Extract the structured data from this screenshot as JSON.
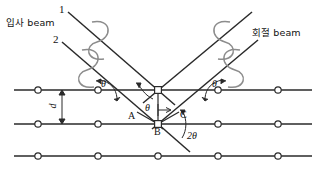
{
  "figure": {
    "colors": {
      "line": "#2a2a2a",
      "wave": "#8c8c8c",
      "text": "#111111",
      "background": "#ffffff",
      "atom_fill": "#ffffff"
    }
  },
  "labels": {
    "incident_beam": "입사 beam",
    "diffracted_beam": "회절 beam",
    "ray_1": "1",
    "ray_2": "2",
    "point_a": "A",
    "point_b": "B",
    "point_c": "C",
    "spacing": "d",
    "theta_left_surface": "θ",
    "theta_right_surface": "θ",
    "theta_interior": "θ",
    "two_theta": "2θ"
  },
  "geometry": {
    "planes": [
      {
        "name": "top-plane",
        "y": 90,
        "x_start": 14,
        "x_end": 312
      },
      {
        "name": "middle-plane",
        "y": 124,
        "x_start": 14,
        "x_end": 312
      },
      {
        "name": "bottom-plane",
        "y": 156,
        "x_start": 14,
        "x_end": 312
      }
    ],
    "interplanar_spacing_px": 34,
    "atom_columns_x": [
      38,
      98,
      158,
      218,
      278
    ],
    "scatter_points": {
      "top": {
        "x": 158,
        "y": 90,
        "marker": "square"
      },
      "middle": {
        "x": 158,
        "y": 124,
        "marker": "square"
      }
    },
    "incident_rays": [
      {
        "name": "ray-1",
        "x1": 68,
        "y1": 12,
        "x2": 158,
        "y2": 90
      },
      {
        "name": "ray-2",
        "x1": 62,
        "y1": 42,
        "x2": 158,
        "y2": 124
      }
    ],
    "diffracted_rays": [
      {
        "name": "ray-1-out",
        "x1": 158,
        "y1": 90,
        "x2": 250,
        "y2": 12
      },
      {
        "name": "ray-2-out",
        "x1": 158,
        "y1": 124,
        "x2": 256,
        "y2": 42
      }
    ],
    "transmitted_ray": {
      "x1": 158,
      "y1": 124,
      "x2": 188,
      "y2": 150
    },
    "path_difference_segments": [
      {
        "name": "segment-ab",
        "from": "A",
        "to": "B"
      },
      {
        "name": "segment-bc",
        "from": "B",
        "to": "C"
      }
    ],
    "point_positions": {
      "A": {
        "x": 137,
        "y": 113
      },
      "B": {
        "x": 158,
        "y": 124
      },
      "C": {
        "x": 178,
        "y": 113
      }
    }
  }
}
